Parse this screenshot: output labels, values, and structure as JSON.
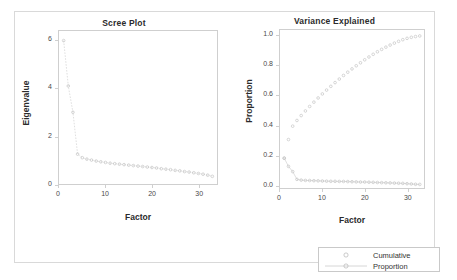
{
  "chart_data": [
    {
      "type": "line",
      "title": "Scree Plot",
      "xlabel": "Factor",
      "ylabel": "Eigenvalue",
      "xlim": [
        0,
        34
      ],
      "ylim": [
        0,
        6.4
      ],
      "xticks": [
        "0",
        "10",
        "20",
        "30"
      ],
      "xtick_values": [
        0,
        10,
        20,
        30
      ],
      "yticks": [
        "0",
        "2",
        "4",
        "6"
      ],
      "ytick_values": [
        0,
        2,
        4,
        6
      ],
      "grid": false,
      "legend": "none",
      "marker": "open-circle",
      "series": [
        {
          "name": "Eigenvalue",
          "x": [
            1,
            2,
            3,
            4,
            5,
            6,
            7,
            8,
            9,
            10,
            11,
            12,
            13,
            14,
            15,
            16,
            17,
            18,
            19,
            20,
            21,
            22,
            23,
            24,
            25,
            26,
            27,
            28,
            29,
            30,
            31,
            32,
            33
          ],
          "values": [
            6.0,
            4.1,
            3.0,
            1.25,
            1.1,
            1.04,
            1.0,
            0.96,
            0.93,
            0.9,
            0.87,
            0.85,
            0.83,
            0.81,
            0.79,
            0.77,
            0.75,
            0.73,
            0.71,
            0.69,
            0.67,
            0.64,
            0.62,
            0.6,
            0.57,
            0.55,
            0.52,
            0.5,
            0.47,
            0.44,
            0.41,
            0.37,
            0.32
          ]
        }
      ]
    },
    {
      "type": "line",
      "title": "Variance Explained",
      "xlabel": "Factor",
      "ylabel": "Proportion",
      "xlim": [
        0,
        34
      ],
      "ylim": [
        -0.02,
        1.04
      ],
      "xticks": [
        "0",
        "10",
        "20",
        "30"
      ],
      "xtick_values": [
        0,
        10,
        20,
        30
      ],
      "yticks": [
        "0.0",
        "0.2",
        "0.4",
        "0.6",
        "0.8",
        "1.0"
      ],
      "ytick_values": [
        0.0,
        0.2,
        0.4,
        0.6,
        0.8,
        1.0
      ],
      "grid": false,
      "legend_position": "below-right",
      "series": [
        {
          "name": "Cumulative",
          "marker": "open-circle",
          "x": [
            1,
            2,
            3,
            4,
            5,
            6,
            7,
            8,
            9,
            10,
            11,
            12,
            13,
            14,
            15,
            16,
            17,
            18,
            19,
            20,
            21,
            22,
            23,
            24,
            25,
            26,
            27,
            28,
            29,
            30,
            31,
            32,
            33
          ],
          "values": [
            0.18,
            0.305,
            0.395,
            0.433,
            0.466,
            0.497,
            0.527,
            0.556,
            0.584,
            0.611,
            0.637,
            0.662,
            0.687,
            0.711,
            0.735,
            0.757,
            0.779,
            0.8,
            0.82,
            0.84,
            0.859,
            0.877,
            0.894,
            0.91,
            0.925,
            0.939,
            0.952,
            0.964,
            0.975,
            0.984,
            0.991,
            0.996,
            1.0
          ]
        },
        {
          "name": "Proportion",
          "marker": "open-circle-line",
          "x": [
            1,
            2,
            3,
            4,
            5,
            6,
            7,
            8,
            9,
            10,
            11,
            12,
            13,
            14,
            15,
            16,
            17,
            18,
            19,
            20,
            21,
            22,
            23,
            24,
            25,
            26,
            27,
            28,
            29,
            30,
            31,
            32,
            33
          ],
          "values": [
            0.18,
            0.125,
            0.09,
            0.038,
            0.033,
            0.031,
            0.03,
            0.029,
            0.028,
            0.027,
            0.026,
            0.025,
            0.025,
            0.024,
            0.024,
            0.023,
            0.022,
            0.021,
            0.02,
            0.02,
            0.019,
            0.018,
            0.017,
            0.016,
            0.015,
            0.014,
            0.013,
            0.012,
            0.011,
            0.009,
            0.007,
            0.005,
            0.004
          ]
        }
      ]
    }
  ],
  "legend": {
    "entries": [
      {
        "label": "Cumulative",
        "key": "open-circle"
      },
      {
        "label": "Proportion",
        "key": "open-circle-line"
      }
    ]
  },
  "colors": {
    "frame": "#cfcfcf",
    "marker": "#bdbdbd",
    "line": "#d0d0d0",
    "text": "#2b2b2b",
    "tick_text": "#4a4a4a",
    "outer_border": "#d9d9d9"
  }
}
